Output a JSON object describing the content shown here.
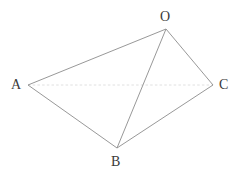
{
  "figure": {
    "background_color": "#ffffff",
    "canvas": {
      "width": 241,
      "height": 179
    },
    "labels": {
      "O": "O",
      "A": "A",
      "C": "C",
      "B": "B"
    },
    "label_color": "#3a3a3a",
    "vertices": [
      {
        "name": "O",
        "x": 166,
        "y": 29
      },
      {
        "name": "A",
        "x": 28,
        "y": 85
      },
      {
        "name": "C",
        "x": 213,
        "y": 85
      },
      {
        "name": "B",
        "x": 117,
        "y": 148
      }
    ],
    "edges": [
      {
        "name": "A-O",
        "from": "A",
        "to": "O",
        "style": "solid",
        "color": "#8c8c8c",
        "width": 0.9
      },
      {
        "name": "O-C",
        "from": "O",
        "to": "C",
        "style": "solid",
        "color": "#8c8c8c",
        "width": 0.9
      },
      {
        "name": "A-B",
        "from": "A",
        "to": "B",
        "style": "solid",
        "color": "#8c8c8c",
        "width": 0.9
      },
      {
        "name": "B-C",
        "from": "B",
        "to": "C",
        "style": "solid",
        "color": "#8c8c8c",
        "width": 0.9
      },
      {
        "name": "O-B",
        "from": "O",
        "to": "B",
        "style": "solid",
        "color": "#8c8c8c",
        "width": 0.9
      },
      {
        "name": "A-C",
        "from": "A",
        "to": "C",
        "style": "faint-dotted",
        "color": "#d8d8d8",
        "width": 0.8
      }
    ]
  }
}
